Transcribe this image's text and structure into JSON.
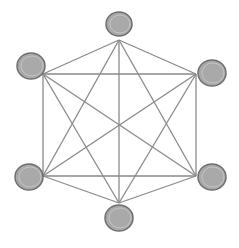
{
  "diagram": {
    "type": "complete-graph",
    "label": "K6",
    "colors": {
      "background": "#ffffff",
      "edge": "#8a8a8a",
      "node_fill": "#a9a9a9",
      "node_stroke": "#6f6f6f",
      "node_inner_ring": "#c4c4c4"
    },
    "nodes": [
      {
        "id": "top",
        "cx": 119,
        "cy": 24,
        "rx": 13,
        "ry": 12,
        "ax": 119,
        "ay": 40
      },
      {
        "id": "upper-left",
        "cx": 31,
        "cy": 66,
        "rx": 14,
        "ry": 13,
        "ax": 43,
        "ay": 74
      },
      {
        "id": "upper-right",
        "cx": 212,
        "cy": 73,
        "rx": 14,
        "ry": 13,
        "ax": 196,
        "ay": 74
      },
      {
        "id": "lower-left",
        "cx": 29,
        "cy": 177,
        "rx": 14,
        "ry": 13,
        "ax": 43,
        "ay": 176
      },
      {
        "id": "lower-right",
        "cx": 212,
        "cy": 177,
        "rx": 14,
        "ry": 13,
        "ax": 196,
        "ay": 176
      },
      {
        "id": "bottom",
        "cx": 119,
        "cy": 218,
        "rx": 14,
        "ry": 13,
        "ax": 119,
        "ay": 203
      }
    ],
    "edges": [
      [
        "top",
        "upper-left"
      ],
      [
        "top",
        "upper-right"
      ],
      [
        "top",
        "lower-left"
      ],
      [
        "top",
        "lower-right"
      ],
      [
        "top",
        "bottom"
      ],
      [
        "upper-left",
        "upper-right"
      ],
      [
        "upper-left",
        "lower-left"
      ],
      [
        "upper-left",
        "lower-right"
      ],
      [
        "upper-left",
        "bottom"
      ],
      [
        "upper-right",
        "lower-left"
      ],
      [
        "upper-right",
        "lower-right"
      ],
      [
        "upper-right",
        "bottom"
      ],
      [
        "lower-left",
        "lower-right"
      ],
      [
        "lower-left",
        "bottom"
      ],
      [
        "lower-right",
        "bottom"
      ]
    ]
  }
}
